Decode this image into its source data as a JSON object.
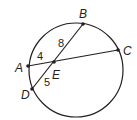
{
  "diagram": {
    "circle": {
      "cx": 76,
      "cy": 70,
      "r": 47
    },
    "points": [
      {
        "name": "A",
        "x": 28,
        "y": 66,
        "lx": 15,
        "ly": 72
      },
      {
        "name": "B",
        "x": 83,
        "y": 24,
        "lx": 79,
        "ly": 18
      },
      {
        "name": "C",
        "x": 118,
        "y": 50,
        "lx": 123,
        "ly": 55
      },
      {
        "name": "D",
        "x": 32,
        "y": 89,
        "lx": 21,
        "ly": 99
      },
      {
        "name": "E",
        "x": 54,
        "y": 62,
        "lx": 52,
        "ly": 79
      }
    ],
    "segments": [
      {
        "from": "A",
        "to": "C"
      },
      {
        "from": "B",
        "to": "D"
      }
    ],
    "lengths": [
      {
        "text": "4",
        "x": 37,
        "y": 60,
        "segment": "AE"
      },
      {
        "text": "8",
        "x": 58,
        "y": 47,
        "segment": "EB"
      },
      {
        "text": "5",
        "x": 44,
        "y": 86,
        "segment": "ED"
      }
    ]
  }
}
